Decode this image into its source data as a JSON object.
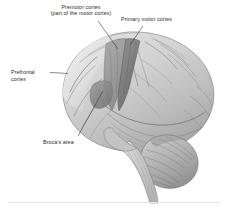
{
  "figure": {
    "background_color": "#ffffff",
    "rule_color": "#e3e3e3",
    "ink_color": "#2b2b2b"
  },
  "labels": {
    "premotor": {
      "line1": "Premotor cortex",
      "line2": "(part of the motor cortex)"
    },
    "primary_motor": "Primary motor cortex",
    "prefrontal": {
      "line1": "Prefrontal",
      "line2": "cortex"
    },
    "brocas": "Broca's area"
  },
  "regions": [
    {
      "name": "premotor-cortex",
      "shade": "#9a9a9a",
      "label_ref": "premotor"
    },
    {
      "name": "primary-motor-cortex",
      "shade": "#7d7d7d",
      "label_ref": "primary_motor"
    },
    {
      "name": "prefrontal-cortex",
      "shade": "#d6d6d6",
      "label_ref": "prefrontal"
    },
    {
      "name": "brocas-area",
      "shade": "#8c8c8c",
      "label_ref": "brocas"
    },
    {
      "name": "cerebellum",
      "shade": "#b4b4b4",
      "label_ref": null
    },
    {
      "name": "brainstem",
      "shade": "#c6c6c6",
      "label_ref": null
    }
  ],
  "leader_lines": [
    {
      "name": "leader-premotor",
      "from": [
        104,
        22
      ],
      "to": [
        118,
        48
      ]
    },
    {
      "name": "leader-primary-motor",
      "from": [
        140,
        26
      ],
      "to": [
        128,
        44
      ]
    },
    {
      "name": "leader-prefrontal",
      "from": [
        49,
        72
      ],
      "to": [
        66,
        75
      ]
    },
    {
      "name": "leader-brocas",
      "from": [
        78,
        136
      ],
      "to": [
        104,
        90
      ]
    }
  ]
}
